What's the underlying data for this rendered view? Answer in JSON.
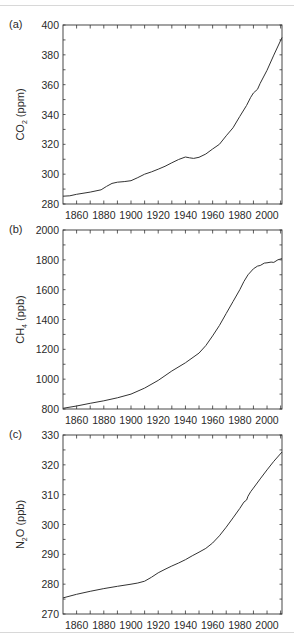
{
  "chart_data": [
    {
      "type": "line",
      "panel_label": "(a)",
      "title": "",
      "xlabel": "",
      "ylabel": "CO2 (ppm)",
      "ylabel_main": "CO",
      "ylabel_sub": "2",
      "ylabel_unit": " (ppm)",
      "xlim": [
        1850,
        2011
      ],
      "ylim": [
        280,
        400
      ],
      "yticks": [
        280,
        300,
        320,
        340,
        360,
        380,
        400
      ],
      "xticks": [
        1860,
        1880,
        1900,
        1920,
        1940,
        1960,
        1980,
        2000
      ],
      "grid": false,
      "series": [
        {
          "name": "CO2",
          "x": [
            1850,
            1855,
            1860,
            1870,
            1878,
            1882,
            1886,
            1890,
            1895,
            1900,
            1905,
            1910,
            1915,
            1920,
            1925,
            1930,
            1935,
            1940,
            1943,
            1946,
            1950,
            1955,
            1960,
            1965,
            1970,
            1975,
            1980,
            1985,
            1988,
            1990,
            1993,
            1995,
            2000,
            2005,
            2011
          ],
          "values": [
            285.2,
            285.5,
            286.5,
            288,
            289.5,
            291.8,
            293.8,
            294.6,
            295,
            295.6,
            297.7,
            300,
            301.5,
            303.3,
            305.3,
            307.6,
            309.8,
            311.5,
            311,
            310.6,
            311.3,
            313.5,
            316.9,
            320,
            325.7,
            331.1,
            338.7,
            346.1,
            351.5,
            354.4,
            356.9,
            360.9,
            369.6,
            379.8,
            391.6
          ]
        }
      ]
    },
    {
      "type": "line",
      "panel_label": "(b)",
      "title": "",
      "xlabel": "",
      "ylabel": "CH4 (ppb)",
      "ylabel_main": "CH",
      "ylabel_sub": "4",
      "ylabel_unit": " (ppb)",
      "xlim": [
        1850,
        2011
      ],
      "ylim": [
        800,
        2000
      ],
      "yticks": [
        800,
        1000,
        1200,
        1400,
        1600,
        1800,
        2000
      ],
      "xticks": [
        1860,
        1880,
        1900,
        1920,
        1940,
        1960,
        1980,
        2000
      ],
      "grid": false,
      "series": [
        {
          "name": "CH4",
          "x": [
            1850,
            1860,
            1870,
            1880,
            1890,
            1900,
            1910,
            1920,
            1930,
            1940,
            1950,
            1955,
            1960,
            1965,
            1970,
            1975,
            1980,
            1983,
            1986,
            1990,
            1993,
            1995,
            1998,
            2000,
            2003,
            2005,
            2008,
            2011
          ],
          "values": [
            805,
            820,
            838,
            855,
            875,
            900,
            940,
            992,
            1055,
            1110,
            1175,
            1225,
            1290,
            1360,
            1440,
            1520,
            1600,
            1655,
            1700,
            1740,
            1758,
            1762,
            1778,
            1780,
            1785,
            1783,
            1800,
            1808
          ]
        }
      ]
    },
    {
      "type": "line",
      "panel_label": "(c)",
      "title": "",
      "xlabel": "",
      "ylabel": "N2O (ppb)",
      "ylabel_main": "N",
      "ylabel_sub": "2",
      "ylabel_unit": "O (ppb)",
      "xlim": [
        1850,
        2011
      ],
      "ylim": [
        270,
        330
      ],
      "yticks": [
        270,
        280,
        290,
        300,
        310,
        320,
        330
      ],
      "xticks": [
        1860,
        1880,
        1900,
        1920,
        1940,
        1960,
        1980,
        2000
      ],
      "grid": false,
      "series": [
        {
          "name": "N2O",
          "x": [
            1850,
            1860,
            1870,
            1880,
            1890,
            1900,
            1905,
            1910,
            1915,
            1920,
            1925,
            1930,
            1935,
            1940,
            1945,
            1950,
            1955,
            1960,
            1965,
            1970,
            1975,
            1980,
            1983,
            1985,
            1986,
            1988,
            1990,
            1995,
            2000,
            2005,
            2011
          ],
          "values": [
            275.4,
            276.6,
            277.6,
            278.5,
            279.3,
            280,
            280.4,
            281,
            282.3,
            283.8,
            285,
            286.1,
            287.1,
            288.2,
            289.5,
            290.7,
            292,
            293.8,
            296.2,
            299.1,
            302.2,
            305.4,
            307.5,
            308.2,
            309.5,
            311,
            312.2,
            315.3,
            318.3,
            321.2,
            324.3
          ]
        }
      ]
    }
  ]
}
